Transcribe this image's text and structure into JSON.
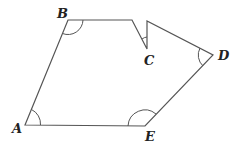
{
  "diagram": {
    "type": "polygon",
    "stroke_color": "#555555",
    "vertices": [
      {
        "id": "A",
        "label": "A",
        "x": 25,
        "y": 125
      },
      {
        "id": "B",
        "label": "B",
        "x": 68,
        "y": 20
      },
      {
        "id": "P1",
        "label": "",
        "x": 132,
        "y": 20
      },
      {
        "id": "C",
        "label": "C",
        "x": 147,
        "y": 49
      },
      {
        "id": "P2",
        "label": "",
        "x": 147,
        "y": 21
      },
      {
        "id": "D",
        "label": "D",
        "x": 213,
        "y": 55
      },
      {
        "id": "E",
        "label": "E",
        "x": 145,
        "y": 126
      }
    ],
    "labels": {
      "A": "A",
      "B": "B",
      "C": "C",
      "D": "D",
      "E": "E"
    },
    "angle_marks": [
      "A",
      "B",
      "C",
      "D",
      "E"
    ]
  }
}
